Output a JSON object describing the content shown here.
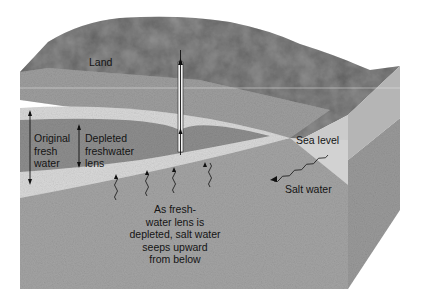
{
  "diagram": {
    "labels": {
      "land": "Land",
      "original_fresh_water": "Original\nfresh\nwater",
      "depleted_lens": "Depleted\nfreshwater\nlens",
      "sea_level": "Sea level",
      "salt_water": "Salt water",
      "caption": "As fresh-\nwater lens is\ndepleted, salt water\nseeps upward\nfrom below"
    },
    "elements": [
      "land-surface",
      "well",
      "original-freshwater-lens",
      "depleted-freshwater-lens",
      "saltwater-arrows",
      "sea-block",
      "saltwater-intrusion-arrow"
    ],
    "colors": {
      "land": "#8a8a8a",
      "aquifer_upper": "#9c9c9c",
      "fresh_band": "#d6d6d6",
      "depleted_lens": "#909090",
      "saltwater_body": "#a3a3a3",
      "sea_top": "#c9c9c9",
      "sea_front": "#b4b4b4",
      "sea_side": "#9a9a9a",
      "text": "#141414"
    }
  }
}
